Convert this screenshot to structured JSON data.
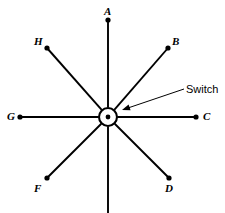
{
  "figure": {
    "name": "rotary-switch-radial-diagram",
    "background_color": "#ffffff",
    "line_color": "#000000",
    "width": 225,
    "height": 213
  },
  "center": {
    "label": "Switch",
    "symbol": "circle-with-center-dot",
    "x": 108,
    "y": 117,
    "outer_radius": 9,
    "pivot_radius": 2.4
  },
  "callout": {
    "text": "Switch",
    "text_x": 186,
    "text_y": 84,
    "leader_start_x": 184,
    "leader_start_y": 89,
    "leader_end_x": 122,
    "leader_end_y": 110
  },
  "terminals": [
    {
      "id": "A",
      "label": "A",
      "angle_deg": 90,
      "end_x": 108,
      "end_y": 20,
      "has_dot": true,
      "label_x": 104,
      "label_y": 6
    },
    {
      "id": "B",
      "label": "B",
      "angle_deg": 45,
      "end_x": 168,
      "end_y": 48,
      "has_dot": true,
      "label_x": 172,
      "label_y": 36
    },
    {
      "id": "C",
      "label": "C",
      "angle_deg": 0,
      "end_x": 196,
      "end_y": 117,
      "has_dot": true,
      "label_x": 203,
      "label_y": 111
    },
    {
      "id": "D",
      "label": "D",
      "angle_deg": -45,
      "end_x": 169,
      "end_y": 178,
      "has_dot": true,
      "label_x": 165,
      "label_y": 183
    },
    {
      "id": "E",
      "label": "",
      "angle_deg": -90,
      "end_x": 108,
      "end_y": 213,
      "has_dot": false,
      "label_x": 104,
      "label_y": 200
    },
    {
      "id": "F",
      "label": "F",
      "angle_deg": -135,
      "end_x": 47,
      "end_y": 178,
      "has_dot": true,
      "label_x": 34,
      "label_y": 183
    },
    {
      "id": "G",
      "label": "G",
      "angle_deg": 180,
      "end_x": 20,
      "end_y": 117,
      "has_dot": true,
      "label_x": 7,
      "label_y": 111
    },
    {
      "id": "H",
      "label": "H",
      "angle_deg": 135,
      "end_x": 47,
      "end_y": 48,
      "has_dot": true,
      "label_x": 34,
      "label_y": 36
    }
  ]
}
